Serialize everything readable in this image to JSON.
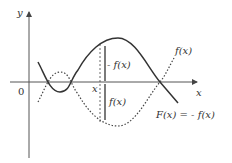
{
  "diagram": {
    "axes": {
      "y_label": "y",
      "x_label": "x",
      "origin_label": "0"
    },
    "point": {
      "x_label": "x"
    },
    "segments": {
      "upper_label": "- f(x)",
      "lower_label": "f(x)"
    },
    "curves": {
      "dotted_label": "f(x)",
      "solid_label": "F(x) = - f(x)"
    },
    "colors": {
      "curve": "#333333",
      "axis": "#555555",
      "background": "#ffffff"
    }
  }
}
